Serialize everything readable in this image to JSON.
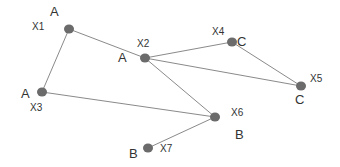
{
  "colors": {
    "node": "#6b6b6b",
    "edge": "#8a8a8a",
    "text": "#333333",
    "background": "#ffffff"
  },
  "nodes": [
    {
      "id": "X1",
      "cluster": "A",
      "x": 69,
      "y": 29,
      "id_label": {
        "x": 32,
        "y": 30
      },
      "cluster_label": {
        "x": 50,
        "y": 16
      }
    },
    {
      "id": "X2",
      "cluster": "A",
      "x": 145,
      "y": 58,
      "id_label": {
        "x": 137,
        "y": 47
      },
      "cluster_label": {
        "x": 118,
        "y": 62
      }
    },
    {
      "id": "X3",
      "cluster": "A",
      "x": 42,
      "y": 92,
      "id_label": {
        "x": 30,
        "y": 111
      },
      "cluster_label": {
        "x": 21,
        "y": 98
      }
    },
    {
      "id": "X4",
      "cluster": "C",
      "x": 232,
      "y": 42,
      "id_label": {
        "x": 212,
        "y": 35
      },
      "cluster_label": {
        "x": 237,
        "y": 46
      }
    },
    {
      "id": "X5",
      "cluster": "C",
      "x": 301,
      "y": 86,
      "id_label": {
        "x": 310,
        "y": 82
      },
      "cluster_label": {
        "x": 295,
        "y": 104
      }
    },
    {
      "id": "X6",
      "cluster": "B",
      "x": 215,
      "y": 117,
      "id_label": {
        "x": 231,
        "y": 116
      },
      "cluster_label": {
        "x": 235,
        "y": 139
      }
    },
    {
      "id": "X7",
      "cluster": "B",
      "x": 148,
      "y": 148,
      "id_label": {
        "x": 160,
        "y": 152
      },
      "cluster_label": {
        "x": 129,
        "y": 158
      }
    }
  ],
  "edges": [
    {
      "from": "X1",
      "to": "X2"
    },
    {
      "from": "X1",
      "to": "X3"
    },
    {
      "from": "X2",
      "to": "X4"
    },
    {
      "from": "X2",
      "to": "X5"
    },
    {
      "from": "X2",
      "to": "X6"
    },
    {
      "from": "X4",
      "to": "X5"
    },
    {
      "from": "X3",
      "to": "X6"
    },
    {
      "from": "X6",
      "to": "X7"
    }
  ]
}
